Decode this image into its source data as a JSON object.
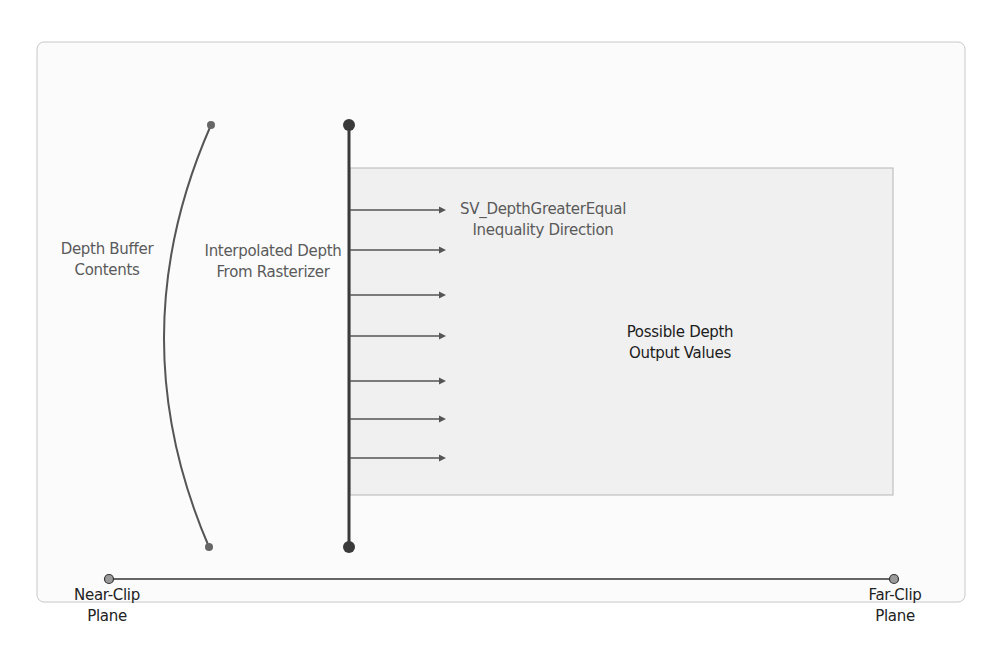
{
  "diagram": {
    "colors": {
      "panel_bg": "#fbfbfb",
      "panel_border": "#c8c8c8",
      "shaded_region": "#f0f0f0",
      "shaded_border": "#b5b5b5",
      "line": "#555555",
      "dark_line": "#3a3a3a",
      "axis": "#333333",
      "endpoint_fill": "#8a8a8a"
    },
    "labels": {
      "depth_buffer": [
        "Depth Buffer",
        "Contents"
      ],
      "interpolated_depth": [
        "Interpolated Depth",
        "From Rasterizer"
      ],
      "inequality": [
        "SV_DepthGreaterEqual",
        "Inequality Direction"
      ],
      "possible_output": [
        "Possible Depth",
        "Output Values"
      ],
      "near_clip": [
        "Near-Clip",
        "Plane"
      ],
      "far_clip": [
        "Far-Clip",
        "Plane"
      ]
    },
    "arrow_count": 7,
    "axis": {
      "start_label": "Near-Clip Plane",
      "end_label": "Far-Clip Plane"
    }
  }
}
